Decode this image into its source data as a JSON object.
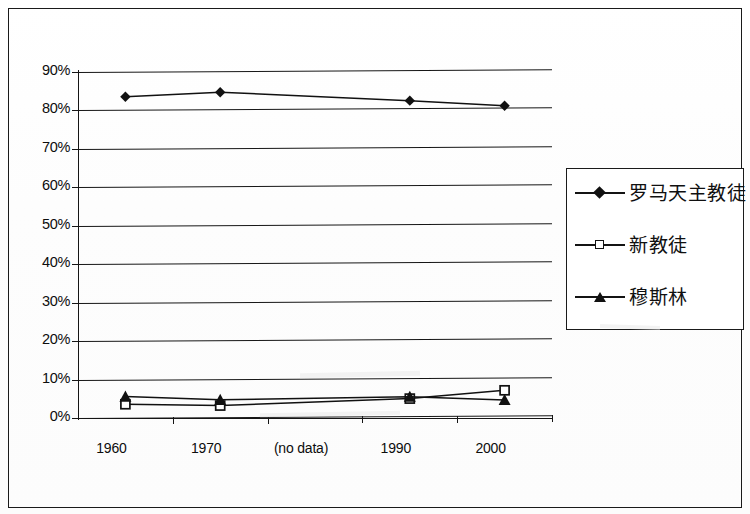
{
  "chart_data": {
    "type": "line",
    "title": "",
    "xlabel": "",
    "ylabel": "",
    "categories": [
      "1960",
      "1970",
      "(no data)",
      "1990",
      "2000"
    ],
    "ylim": [
      0,
      90
    ],
    "yticks": [
      "0%",
      "10%",
      "20%",
      "30%",
      "40%",
      "50%",
      "60%",
      "70%",
      "80%",
      "90%"
    ],
    "ytick_values": [
      0,
      10,
      20,
      30,
      40,
      50,
      60,
      70,
      80,
      90
    ],
    "grid": true,
    "legend_position": "right",
    "series": [
      {
        "name": "罗马天主教徒",
        "marker": "filled-diamond",
        "values": [
          83.5,
          84.5,
          null,
          82.0,
          80.5
        ]
      },
      {
        "name": "新教徒",
        "marker": "open-square",
        "values": [
          3.5,
          3.0,
          null,
          4.5,
          6.5
        ]
      },
      {
        "name": "穆斯林",
        "marker": "filled-triangle",
        "values": [
          5.5,
          4.5,
          null,
          5.0,
          4.0
        ]
      }
    ]
  },
  "legend": {
    "entries": [
      {
        "label": "罗马天主教徒",
        "marker": "filled-diamond"
      },
      {
        "label": "新教徒",
        "marker": "open-square"
      },
      {
        "label": "穆斯林",
        "marker": "filled-triangle"
      }
    ]
  },
  "axis": {
    "y_labels": [
      "90%",
      "80%",
      "70%",
      "60%",
      "50%",
      "40%",
      "30%",
      "20%",
      "10%",
      "0%"
    ],
    "x_labels": [
      "1960",
      "1970",
      "(no data)",
      "1990",
      "2000"
    ]
  },
  "colors": {
    "ink": "#111111",
    "paper": "#ffffff",
    "grid": "#161616"
  }
}
